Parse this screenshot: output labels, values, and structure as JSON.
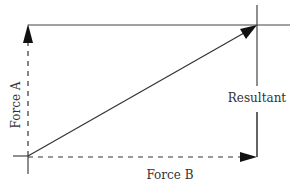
{
  "diagram": {
    "labels": {
      "force_a": "Force A",
      "force_b": "Force B",
      "resultant": "Resultant"
    },
    "colors": {
      "line": "#222222",
      "dashed": "#333333",
      "text": "#333333"
    }
  }
}
